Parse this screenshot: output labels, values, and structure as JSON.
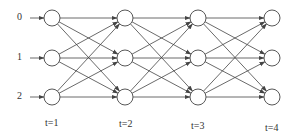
{
  "diagram": {
    "type": "trellis",
    "states": [
      "0",
      "1",
      "2"
    ],
    "time_steps": [
      "t=1",
      "t=2",
      "t=3",
      "t=4"
    ],
    "colors": {
      "stroke": "#444444",
      "text": "#333333",
      "background": "#ffffff"
    },
    "columns_x": [
      52,
      125,
      198,
      272
    ],
    "rows_y": [
      18,
      58,
      97
    ],
    "node_radius": 8,
    "time_label_y": [
      118,
      118,
      120,
      122
    ]
  }
}
